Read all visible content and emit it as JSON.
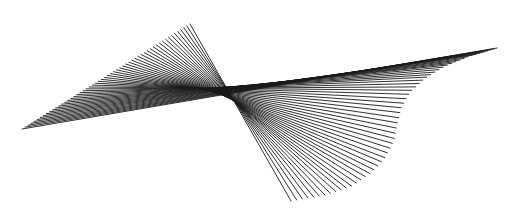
{
  "canvas": {
    "width": 521,
    "height": 212,
    "background": "#ffffff",
    "stroke": "#1a1a1a"
  },
  "figure": {
    "type": "string-art-ruled-surface",
    "line_count": 56,
    "left_edge": {
      "start": [
        22,
        129
      ],
      "end": [
        190,
        24
      ]
    },
    "right_edge_curve": [
      [
        497,
        48
      ],
      [
        470,
        56
      ],
      [
        445,
        66
      ],
      [
        425,
        78
      ],
      [
        410,
        92
      ],
      [
        401,
        108
      ],
      [
        397,
        124
      ],
      [
        394,
        140
      ],
      [
        385,
        158
      ],
      [
        372,
        172
      ],
      [
        352,
        186
      ],
      [
        325,
        195
      ],
      [
        291,
        201
      ]
    ]
  }
}
